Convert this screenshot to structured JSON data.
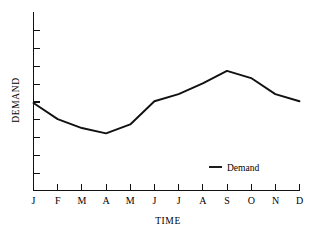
{
  "chart_data": {
    "type": "line",
    "title": "",
    "xlabel": "TIME",
    "ylabel": "DEMAND",
    "categories": [
      "J",
      "F",
      "M",
      "A",
      "M",
      "J",
      "J",
      "A",
      "S",
      "O",
      "N",
      "D"
    ],
    "series": [
      {
        "name": "Demand",
        "values": [
          49,
          40,
          35,
          32,
          37,
          50,
          54,
          60,
          67,
          63,
          54,
          50
        ],
        "color": "#111111"
      }
    ],
    "ylim": [
      0,
      100
    ],
    "y_tick_count": 10,
    "y_tick_labels": [],
    "x_tick_labels": [
      "J",
      "F",
      "M",
      "A",
      "M",
      "J",
      "J",
      "A",
      "S",
      "O",
      "N",
      "D"
    ],
    "grid": false,
    "legend": {
      "position": "inside-lower-right",
      "entries": [
        {
          "label": "Demand",
          "marker": "line-dash",
          "color": "#111111"
        }
      ]
    },
    "axes": {
      "y_axis_visible": true,
      "x_axis_visible": true,
      "y_axis_labels_shown": false
    }
  },
  "page": {
    "background_color": "#ffffff",
    "ink_color": "#111111"
  }
}
